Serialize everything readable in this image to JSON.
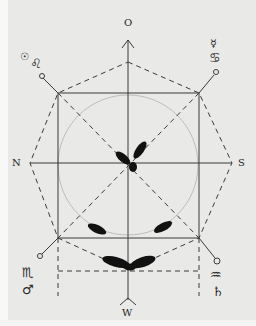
{
  "diagram": {
    "type": "hand-drawn astrological / cardinal-direction figure",
    "colors": {
      "paper": "#e9e9e7",
      "ink": "#2a2a2a",
      "circle": "#b9b9b6",
      "blob": "#111111"
    },
    "directions": {
      "top": "O",
      "left": "N",
      "right": "S",
      "bottom": "W"
    },
    "corner_symbols": {
      "top_left": [
        "sun-symbol",
        "leo-symbol"
      ],
      "top_right": [
        "mercury-symbol",
        "cancer-symbol"
      ],
      "bottom_left": [
        "scorpio-symbol",
        "mars-symbol"
      ],
      "bottom_right": [
        "aquarius-symbol",
        "saturn-symbol"
      ]
    },
    "glyphs": {
      "sun": "☉",
      "leo": "♌",
      "mercury": "☿",
      "cancer": "♋",
      "scorpio": "♏",
      "mars": "♂",
      "aquarius": "♒",
      "saturn": "♄"
    }
  }
}
